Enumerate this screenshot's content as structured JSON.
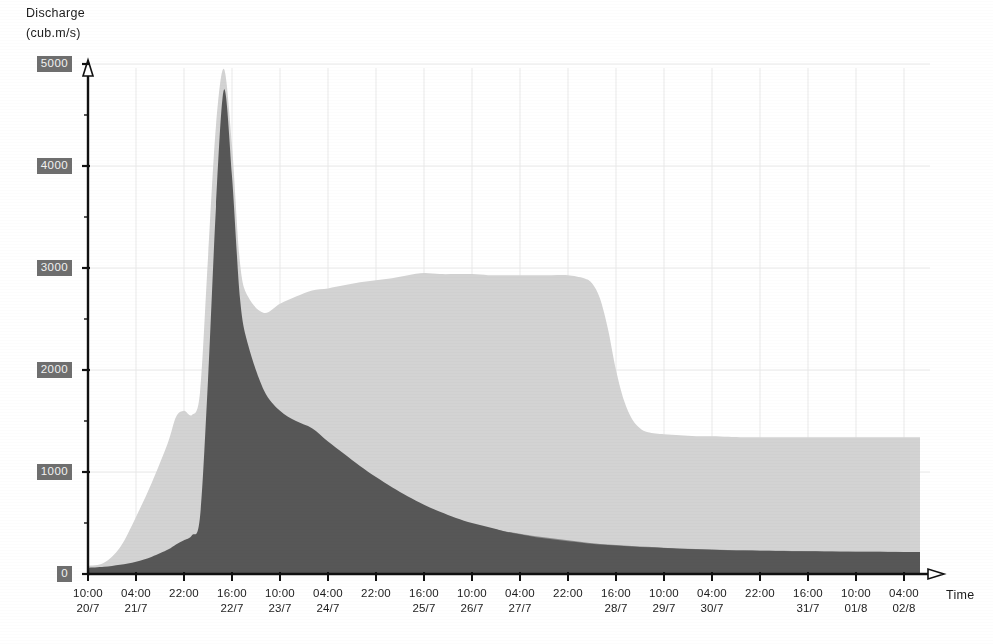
{
  "axes": {
    "y_title_line1": "Discharge",
    "y_title_line2": "(cub.m/s)",
    "x_title": "Time",
    "y_ticks": [
      "0",
      "1000",
      "2000",
      "3000",
      "4000",
      "5000"
    ],
    "x_ticks": [
      {
        "time": "10:00",
        "date": "20/7"
      },
      {
        "time": "04:00",
        "date": "21/7"
      },
      {
        "time": "22:00",
        "date": ""
      },
      {
        "time": "16:00",
        "date": "22/7"
      },
      {
        "time": "10:00",
        "date": "23/7"
      },
      {
        "time": "04:00",
        "date": "24/7"
      },
      {
        "time": "22:00",
        "date": ""
      },
      {
        "time": "16:00",
        "date": "25/7"
      },
      {
        "time": "10:00",
        "date": "26/7"
      },
      {
        "time": "04:00",
        "date": "27/7"
      },
      {
        "time": "22:00",
        "date": ""
      },
      {
        "time": "16:00",
        "date": "28/7"
      },
      {
        "time": "10:00",
        "date": "29/7"
      },
      {
        "time": "04:00",
        "date": "30/7"
      },
      {
        "time": "22:00",
        "date": ""
      },
      {
        "time": "16:00",
        "date": "31/7"
      },
      {
        "time": "10:00",
        "date": "01/8"
      },
      {
        "time": "04:00",
        "date": "02/8"
      }
    ]
  },
  "colors": {
    "series_light": "#d3d3d3",
    "series_medium": "#8d8d8d",
    "series_dark": "#575757",
    "axis_line": "#111111",
    "gridline": "#e9e9e9",
    "tick_label_bg": "#6e6e6e",
    "tick_label_fg": "#f2f2f2",
    "text": "#1c1c1c",
    "background": "#ffffff"
  },
  "chart_data": {
    "type": "area",
    "title": "",
    "subtitle": "",
    "xlabel": "Time",
    "ylabel": "Discharge (cub.m/s)",
    "ylim": [
      0,
      5000
    ],
    "grid": true,
    "legend_position": "none",
    "stacking": "overlaid",
    "x_tick_labels": [
      "10:00 20/7",
      "04:00 21/7",
      "22:00",
      "16:00 22/7",
      "10:00 23/7",
      "04:00 24/7",
      "22:00",
      "16:00 25/7",
      "10:00 26/7",
      "04:00 27/7",
      "22:00",
      "16:00 28/7",
      "10:00 29/7",
      "04:00 30/7",
      "22:00",
      "16:00 31/7",
      "10:00 01/8",
      "04:00 02/8"
    ],
    "x_hours_from_start": [
      0,
      18,
      36,
      54,
      72,
      90,
      108,
      126,
      144,
      162,
      180,
      198,
      216,
      234,
      252,
      270,
      288,
      306
    ],
    "series": [
      {
        "name": "light-grey-area",
        "color": "#d3d3d3",
        "x": [
          0,
          6,
          12,
          18,
          24,
          30,
          33,
          36,
          39,
          42,
          45,
          48,
          51,
          54,
          57,
          60,
          66,
          72,
          78,
          84,
          90,
          96,
          102,
          108,
          114,
          120,
          126,
          132,
          138,
          144,
          150,
          156,
          162,
          168,
          174,
          180,
          186,
          189,
          192,
          195,
          198,
          201,
          204,
          207,
          210,
          216,
          222,
          228,
          234,
          240,
          246,
          252,
          258,
          264,
          270,
          276,
          282,
          288,
          294,
          300,
          306,
          312
        ],
        "values": [
          80,
          110,
          260,
          560,
          900,
          1290,
          1540,
          1600,
          1560,
          1780,
          3100,
          4400,
          4950,
          4200,
          3050,
          2720,
          2560,
          2650,
          2720,
          2780,
          2800,
          2830,
          2860,
          2880,
          2900,
          2930,
          2950,
          2940,
          2940,
          2940,
          2930,
          2930,
          2930,
          2930,
          2930,
          2930,
          2900,
          2850,
          2700,
          2400,
          2000,
          1700,
          1520,
          1430,
          1390,
          1370,
          1360,
          1350,
          1350,
          1345,
          1340,
          1340,
          1340,
          1340,
          1340,
          1340,
          1340,
          1340,
          1340,
          1340,
          1340,
          1340
        ]
      },
      {
        "name": "dark-grey-area",
        "color": "#575757",
        "x": [
          0,
          6,
          12,
          18,
          24,
          30,
          33,
          36,
          39,
          42,
          45,
          48,
          51,
          54,
          57,
          60,
          66,
          72,
          78,
          84,
          90,
          96,
          102,
          108,
          114,
          120,
          126,
          132,
          138,
          144,
          150,
          156,
          162,
          168,
          174,
          180,
          186,
          192,
          198,
          204,
          210,
          216,
          222,
          228,
          234,
          240,
          246,
          252,
          258,
          264,
          270,
          276,
          282,
          288,
          294,
          300,
          306,
          312
        ],
        "values": [
          60,
          70,
          90,
          120,
          170,
          240,
          290,
          330,
          380,
          560,
          1900,
          3600,
          4750,
          3900,
          2700,
          2250,
          1800,
          1600,
          1500,
          1430,
          1300,
          1180,
          1060,
          950,
          850,
          760,
          680,
          610,
          550,
          500,
          460,
          420,
          390,
          360,
          340,
          320,
          305,
          290,
          280,
          270,
          262,
          255,
          248,
          243,
          238,
          234,
          230,
          228,
          226,
          224,
          222,
          220,
          219,
          218,
          217,
          216,
          215,
          215
        ]
      },
      {
        "name": "medium-grey-area",
        "color": "#8d8d8d",
        "x": [
          0,
          6,
          12,
          18,
          24,
          30,
          33,
          36,
          39,
          42,
          45,
          48,
          51,
          54,
          57,
          60,
          66,
          72,
          78,
          84,
          90,
          96,
          102,
          108,
          114,
          120,
          126,
          132,
          138,
          144,
          150,
          156,
          162,
          168,
          174,
          180,
          186,
          192,
          198,
          204,
          210,
          216,
          222,
          228,
          234,
          240,
          246,
          252,
          258,
          264,
          270,
          276,
          282,
          288,
          294,
          300,
          306,
          312
        ],
        "values": [
          55,
          60,
          75,
          100,
          140,
          190,
          230,
          270,
          310,
          420,
          700,
          980,
          1080,
          1150,
          1280,
          1400,
          1450,
          1430,
          1350,
          1250,
          1130,
          1020,
          920,
          830,
          750,
          680,
          620,
          570,
          520,
          480,
          450,
          420,
          395,
          370,
          350,
          330,
          312,
          295,
          285,
          275,
          266,
          258,
          250,
          245,
          240,
          236,
          232,
          229,
          227,
          225,
          223,
          221,
          220,
          219,
          218,
          217,
          216,
          216
        ]
      }
    ]
  }
}
